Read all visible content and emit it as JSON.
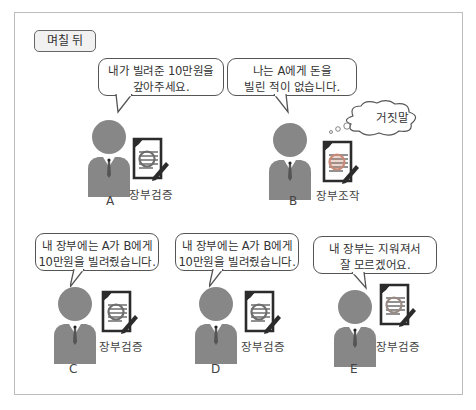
{
  "scene_label": "며칠 뒤",
  "colors": {
    "person": "#878787",
    "frame": "#bcbcbc",
    "lens_normal": "#8a8a8a",
    "lens_tampered": "#c98a78"
  },
  "characters": [
    {
      "id": "A",
      "letter": "A",
      "speech": [
        "내가 빌려준 10만원을",
        "갚아주세요."
      ],
      "ledger_caption": "장부검증",
      "ledger_state": "verified"
    },
    {
      "id": "B",
      "letter": "B",
      "speech": [
        "나는 A에게 돈을",
        "빌린 적이 없습니다."
      ],
      "ledger_caption": "장부조작",
      "ledger_state": "tampered",
      "thought": "거짓말"
    },
    {
      "id": "C",
      "letter": "C",
      "speech": [
        "내 장부에는 A가 B에게",
        "10만원을 빌려줬습니다."
      ],
      "ledger_caption": "장부검증",
      "ledger_state": "verified"
    },
    {
      "id": "D",
      "letter": "D",
      "speech": [
        "내 장부에는 A가 B에게",
        "10만원을 빌려줬습니다."
      ],
      "ledger_caption": "장부검증",
      "ledger_state": "verified"
    },
    {
      "id": "E",
      "letter": "E",
      "speech": [
        "내 장부는 지워져서",
        "잘 모르겠어요."
      ],
      "ledger_caption": "장부검증",
      "ledger_state": "erased"
    }
  ]
}
